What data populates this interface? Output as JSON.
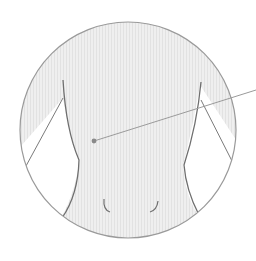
{
  "diagram": {
    "circle": {
      "cx": 128,
      "cy": 130,
      "r": 108,
      "stroke": "#9a9a9a",
      "fill": "#ececec"
    },
    "marker": {
      "x": 94,
      "y": 141,
      "color": "#8a8a8a"
    },
    "pointer_line": {
      "x1": 94,
      "y1": 141,
      "x2": 256,
      "y2": 90,
      "color": "#9a9a9a"
    },
    "body_outline_color": "#6f6f6f"
  }
}
